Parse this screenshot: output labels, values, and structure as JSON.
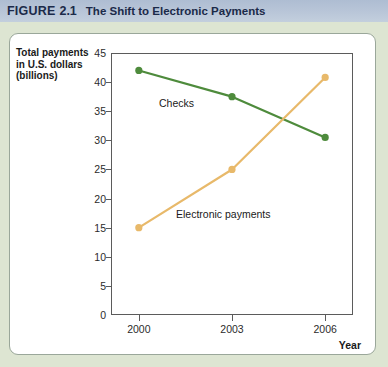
{
  "header": {
    "figure_word": "FIGURE",
    "figure_number": "2.1",
    "title": "The Shift to Electronic Payments",
    "band_color": "#b5c3d6",
    "text_color": "#1b2a49"
  },
  "page": {
    "background_color": "#dde5d2",
    "panel_color": "#ffffff",
    "panel_border_color": "#9aa79a"
  },
  "chart_data": {
    "type": "line",
    "title": "The Shift to Electronic Payments",
    "xlabel": "Year",
    "ylabel": "Total payments in U.S. dollars (billions)",
    "x": [
      "2000",
      "2003",
      "2006"
    ],
    "categories": [
      "2000",
      "2003",
      "2006"
    ],
    "series": [
      {
        "name": "Checks",
        "color": "#4e8b3c",
        "marker": "circle",
        "values": [
          42,
          37.5,
          30.5
        ]
      },
      {
        "name": "Electronic payments",
        "color": "#e8b96a",
        "marker": "circle",
        "values": [
          15,
          25,
          40.8
        ]
      }
    ],
    "ylim": [
      0,
      45
    ],
    "yticks": [
      0,
      5,
      10,
      15,
      20,
      25,
      30,
      35,
      40,
      45
    ],
    "ytick_labels": [
      "0",
      "5",
      "10",
      "15",
      "20",
      "25",
      "30",
      "35",
      "40",
      "45"
    ],
    "xtick_labels": [
      "2000",
      "2003",
      "2006"
    ],
    "grid": false,
    "legend": "inline-annotations",
    "annotations": [
      {
        "text": "Checks",
        "series": "Checks"
      },
      {
        "text": "Electronic payments",
        "series": "Electronic payments"
      }
    ]
  },
  "axis": {
    "y_title_lines": [
      "Total payments",
      "in U.S. dollars",
      "(billions)"
    ],
    "x_title": "Year"
  }
}
